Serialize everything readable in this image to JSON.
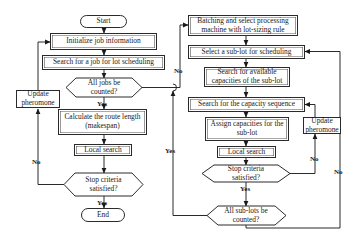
{
  "left_flow": {
    "start": "Start",
    "initialize": "Initialize job information",
    "search_job": "Search for a job for lot scheduling",
    "all_jobs_decision": "All jobs be counted?",
    "calculate": "Calculate the route length (makespan)",
    "local_search": "Local search",
    "stop_decision": "Stop criteria satisfied?",
    "end": "End",
    "update_pheromone": "Update pheromone"
  },
  "right_flow": {
    "batching": "Batching and select processing machine with lot-sizing rule",
    "select_sublot": "Select a sub-lot for scheduling",
    "search_capacities": "Search for available capacities of the sub-lot",
    "search_sequence": "Search for the capacity sequence",
    "assign": "Assign capacities for the sub-lot",
    "update_pheromone": "Update pheromone",
    "local_search": "Local search",
    "stop_decision": "Stop criteria satisfied?",
    "all_sublots_decision": "All sub-lots be counted?"
  },
  "edge_labels": {
    "left_yes_1": "Yes",
    "left_yes_2": "Yes",
    "left_no_loop": "No",
    "jobs_no": "No",
    "sublots_yes": "Yes",
    "right_yes": "Yes",
    "right_no_inner": "No",
    "right_no_outer": "No"
  }
}
